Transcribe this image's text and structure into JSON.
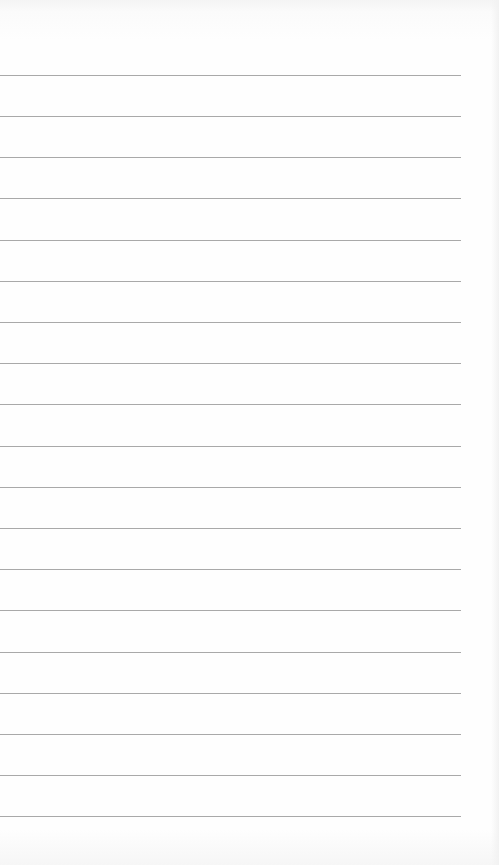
{
  "paper": {
    "type": "lined-paper",
    "background_color": "#fdfdfd",
    "line_color": "#a9a9a9",
    "line_count": 19,
    "lines": [
      {
        "y": 75
      },
      {
        "y": 116
      },
      {
        "y": 157
      },
      {
        "y": 198
      },
      {
        "y": 240
      },
      {
        "y": 281
      },
      {
        "y": 322
      },
      {
        "y": 363
      },
      {
        "y": 404
      },
      {
        "y": 446
      },
      {
        "y": 487
      },
      {
        "y": 528
      },
      {
        "y": 569
      },
      {
        "y": 610
      },
      {
        "y": 652
      },
      {
        "y": 693
      },
      {
        "y": 734
      },
      {
        "y": 775
      },
      {
        "y": 816
      }
    ]
  }
}
